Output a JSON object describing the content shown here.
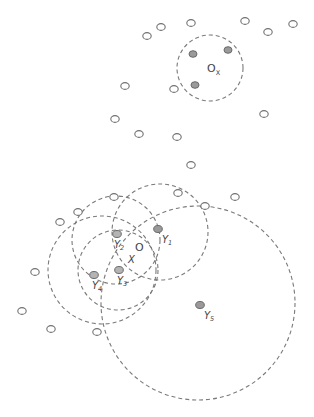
{
  "diagram": {
    "type": "point-cluster-neighborhoods",
    "empty_points": [
      [
        147,
        36
      ],
      [
        161,
        27
      ],
      [
        191,
        23
      ],
      [
        245,
        21
      ],
      [
        268,
        32
      ],
      [
        293,
        24
      ],
      [
        125,
        86
      ],
      [
        174,
        89
      ],
      [
        264,
        114
      ],
      [
        115,
        119
      ],
      [
        139,
        134
      ],
      [
        177,
        137
      ],
      [
        191,
        165
      ],
      [
        60,
        222
      ],
      [
        78,
        212
      ],
      [
        114,
        197
      ],
      [
        178,
        193
      ],
      [
        205,
        206
      ],
      [
        235,
        197
      ],
      [
        35,
        272
      ],
      [
        22,
        311
      ],
      [
        51,
        329
      ],
      [
        97,
        332
      ]
    ],
    "cluster_ox": {
      "label_main": "O",
      "label_sub": "X",
      "label_pos": [
        207,
        72
      ],
      "circle": {
        "cx": 210,
        "cy": 68,
        "r": 33
      },
      "points": [
        [
          193,
          54
        ],
        [
          228,
          50
        ],
        [
          195,
          85
        ]
      ]
    },
    "center_label": {
      "main": "O",
      "sub": "X",
      "o_pos": [
        135,
        251
      ],
      "x_pos": [
        128,
        263
      ]
    },
    "y_points": [
      {
        "id": "Y1",
        "main": "Y",
        "sub": "1",
        "pos": [
          158,
          229
        ],
        "label_pos": [
          162,
          243
        ]
      },
      {
        "id": "Y2",
        "main": "Y",
        "sub": "2",
        "pos": [
          117,
          234
        ],
        "label_pos": [
          114,
          248
        ]
      },
      {
        "id": "Y3",
        "main": "Y",
        "sub": "3",
        "pos": [
          119,
          270
        ],
        "label_pos": [
          117,
          284
        ]
      },
      {
        "id": "Y4",
        "main": "Y",
        "sub": "4",
        "pos": [
          94,
          275
        ],
        "label_pos": [
          92,
          289
        ]
      },
      {
        "id": "Y5",
        "main": "Y",
        "sub": "5",
        "pos": [
          200,
          305
        ],
        "label_pos": [
          204,
          319
        ]
      }
    ],
    "neighborhood_circles": [
      {
        "name": "circle-y2",
        "cx": 116,
        "cy": 240,
        "r": 44
      },
      {
        "name": "circle-y1",
        "cx": 160,
        "cy": 232,
        "r": 48
      },
      {
        "name": "circle-y4",
        "cx": 102,
        "cy": 270,
        "r": 54
      },
      {
        "name": "circle-y3",
        "cx": 118,
        "cy": 270,
        "r": 40
      },
      {
        "name": "circle-y5",
        "cx": 198,
        "cy": 303,
        "r": 97
      }
    ]
  }
}
